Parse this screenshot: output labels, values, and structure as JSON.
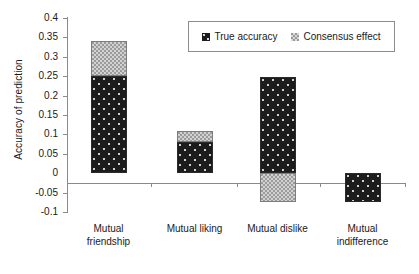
{
  "chart_data": {
    "type": "bar",
    "subtype": "stacked-bar",
    "title": "",
    "xlabel": "",
    "ylabel": "Accuracy of prediction",
    "ylim": [
      -0.1,
      0.4
    ],
    "ytick_step": 0.05,
    "ytick_labels": [
      "0.4",
      "0.35",
      "0.3",
      "0.25",
      "0.2",
      "0.15",
      "0.1",
      "0.05",
      "0",
      "-0.05",
      "-0.1"
    ],
    "ytick_values": [
      0.4,
      0.35,
      0.3,
      0.25,
      0.2,
      0.15,
      0.1,
      0.05,
      0,
      -0.05,
      -0.1
    ],
    "grid": false,
    "legend_position": "top-right",
    "categories": [
      "Mutual friendship",
      "Mutual liking",
      "Mutual dislike",
      "Mutual indifference"
    ],
    "category_lines": [
      [
        "Mutual",
        "friendship"
      ],
      [
        "Mutual liking"
      ],
      [
        "Mutual dislike"
      ],
      [
        "Mutual",
        "indifference"
      ]
    ],
    "series": [
      {
        "name": "True accuracy",
        "color": "#1c1c1c",
        "values": [
          0.25,
          0.08,
          0.248,
          -0.073
        ]
      },
      {
        "name": "Consensus effect",
        "color": "#9b9b9b",
        "values": [
          0.09,
          0.03,
          -0.073,
          0
        ]
      }
    ],
    "stack_totals": [
      0.34,
      0.11,
      0.248,
      -0.073
    ]
  },
  "legend": {
    "items": [
      {
        "label": "True accuracy",
        "swatch": "dark-speckled-swatch"
      },
      {
        "label": "Consensus effect",
        "swatch": "light-checkered-swatch"
      }
    ]
  },
  "axes": {
    "y_title": "Accuracy of prediction"
  }
}
